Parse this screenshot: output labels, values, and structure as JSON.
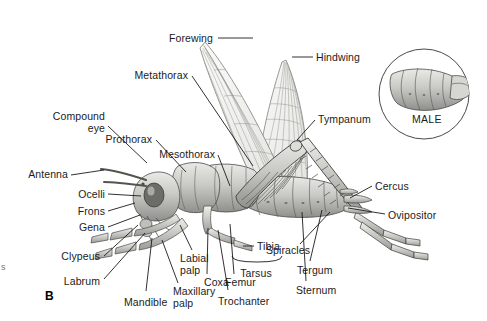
{
  "figure": {
    "panel_label": "B",
    "background_color": "#ffffff",
    "line_color": "#1b1b1b",
    "body_fill": "#c9c9c6",
    "wing_fill": "#ededea",
    "width": 487,
    "height": 321
  },
  "inset": {
    "caption": "MALE",
    "shape": "circle",
    "cx": 424,
    "cy": 94,
    "r": 46
  },
  "labels": [
    {
      "id": "forewing",
      "text": "Forewing",
      "x": 213,
      "y": 33,
      "align": "right",
      "leader": [
        [
          218,
          38
        ],
        [
          253,
          38
        ]
      ]
    },
    {
      "id": "hindwing",
      "text": "Hindwing",
      "x": 316,
      "y": 52,
      "align": "left",
      "leader": [
        [
          313,
          57
        ],
        [
          292,
          57
        ]
      ]
    },
    {
      "id": "metathorax",
      "text": "Metathorax",
      "x": 188,
      "y": 70,
      "align": "right",
      "leader": [
        [
          192,
          76
        ],
        [
          253,
          166
        ]
      ]
    },
    {
      "id": "tympanum",
      "text": "Tympanum",
      "x": 318,
      "y": 114,
      "align": "left",
      "leader": [
        [
          315,
          120
        ],
        [
          297,
          140
        ]
      ]
    },
    {
      "id": "compound-eye",
      "text": "Compound\neye",
      "x": 105,
      "y": 111,
      "align": "right",
      "leader": [
        [
          108,
          126
        ],
        [
          147,
          163
        ]
      ]
    },
    {
      "id": "prothorax",
      "text": "Prothorax",
      "x": 152,
      "y": 134,
      "align": "right",
      "leader": [
        [
          156,
          140
        ],
        [
          186,
          172
        ]
      ]
    },
    {
      "id": "mesothorax",
      "text": "Mesothorax",
      "x": 215,
      "y": 149,
      "align": "right",
      "leader": [
        [
          218,
          155
        ],
        [
          230,
          186
        ]
      ]
    },
    {
      "id": "antenna",
      "text": "Antenna",
      "x": 68,
      "y": 169,
      "align": "right",
      "leader": [
        [
          71,
          175
        ],
        [
          104,
          170
        ]
      ]
    },
    {
      "id": "ocelli",
      "text": "Ocelli",
      "x": 105,
      "y": 189,
      "align": "right",
      "leader": [
        [
          108,
          194
        ],
        [
          141,
          196
        ]
      ]
    },
    {
      "id": "frons",
      "text": "Frons",
      "x": 105,
      "y": 206,
      "align": "right",
      "leader": [
        [
          108,
          211
        ],
        [
          135,
          203
        ]
      ]
    },
    {
      "id": "gena",
      "text": "Gena",
      "x": 105,
      "y": 222,
      "align": "right",
      "leader": [
        [
          108,
          227
        ],
        [
          140,
          215
        ]
      ]
    },
    {
      "id": "clypeus",
      "text": "Clypeus",
      "x": 100,
      "y": 251,
      "align": "right",
      "leader": [
        [
          104,
          256
        ],
        [
          138,
          225
        ]
      ]
    },
    {
      "id": "labrum",
      "text": "Labrum",
      "x": 100,
      "y": 276,
      "align": "right",
      "leader": [
        [
          104,
          279
        ],
        [
          145,
          233
        ]
      ]
    },
    {
      "id": "mandible",
      "text": "Mandible",
      "x": 124,
      "y": 297,
      "align": "left",
      "leader": [
        [
          146,
          291
        ],
        [
          152,
          238
        ]
      ]
    },
    {
      "id": "maxillary-palp",
      "text": "Maxillary\npalp",
      "x": 173,
      "y": 286,
      "align": "left",
      "leader": [
        [
          178,
          283
        ],
        [
          162,
          240
        ]
      ]
    },
    {
      "id": "labial-palp",
      "text": "Labial\npalp",
      "x": 180,
      "y": 253,
      "align": "left",
      "leader": [
        [
          192,
          250
        ],
        [
          180,
          225
        ]
      ]
    },
    {
      "id": "coxa",
      "text": "Coxa",
      "x": 204,
      "y": 277,
      "align": "left",
      "leader": [
        [
          207,
          274
        ],
        [
          208,
          228
        ]
      ]
    },
    {
      "id": "trochanter",
      "text": "Trochanter",
      "x": 218,
      "y": 296,
      "align": "left",
      "leader": [
        [
          228,
          290
        ],
        [
          218,
          230
        ]
      ]
    },
    {
      "id": "femur",
      "text": "Femur",
      "x": 225,
      "y": 277,
      "align": "left",
      "leader": [
        [
          234,
          274
        ],
        [
          230,
          224
        ]
      ]
    },
    {
      "id": "tibia",
      "text": "Tibia",
      "x": 257,
      "y": 241,
      "align": "left",
      "leader": [
        [
          254,
          246
        ],
        [
          243,
          246
        ]
      ]
    },
    {
      "id": "tarsus",
      "text": "Tarsus",
      "x": 256,
      "y": 268,
      "align": "center",
      "leader": null
    },
    {
      "id": "sternum",
      "text": "Sternum",
      "x": 296,
      "y": 285,
      "align": "left",
      "leader": [
        [
          306,
          281
        ],
        [
          302,
          212
        ]
      ]
    },
    {
      "id": "tergum",
      "text": "Tergum",
      "x": 297,
      "y": 265,
      "align": "left",
      "leader": [
        [
          310,
          261
        ],
        [
          322,
          210
        ]
      ]
    },
    {
      "id": "spiracles",
      "text": "Spiracles",
      "x": 266,
      "y": 245,
      "align": "left",
      "leader": [
        [
          300,
          244
        ],
        [
          330,
          212
        ]
      ]
    },
    {
      "id": "cercus",
      "text": "Cercus",
      "x": 375,
      "y": 181,
      "align": "left",
      "leader": [
        [
          372,
          186
        ],
        [
          350,
          198
        ]
      ]
    },
    {
      "id": "ovipositor",
      "text": "Ovipositor",
      "x": 388,
      "y": 210,
      "align": "left",
      "leader": [
        [
          385,
          214
        ],
        [
          348,
          208
        ]
      ]
    }
  ],
  "brace": {
    "id": "tarsus-brace",
    "x1": 232,
    "x2": 282,
    "y": 256,
    "depth": 6
  },
  "edge_artifact": "s"
}
